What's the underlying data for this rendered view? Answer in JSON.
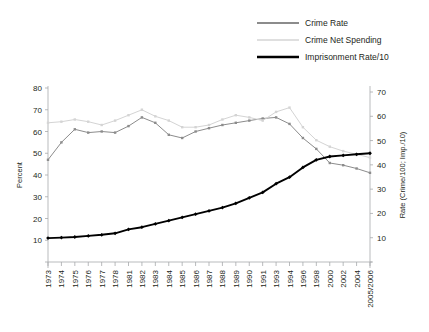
{
  "chart_data": {
    "type": "line",
    "title": "",
    "xlabel": "",
    "ylabel": "Percent",
    "y2label": "Rate (Crime/100; Imp./10)",
    "ylim": [
      0,
      80
    ],
    "y2lim": [
      0,
      70
    ],
    "yticks": [
      0,
      10,
      20,
      30,
      40,
      50,
      60,
      70,
      80
    ],
    "ytick_labels": [
      "",
      "10",
      "20",
      "30",
      "40",
      "50",
      "60",
      "70",
      "80"
    ],
    "y2ticks": [
      0,
      10,
      20,
      30,
      40,
      50,
      60,
      70
    ],
    "y2tick_labels": [
      "",
      "10",
      "20",
      "30",
      "40",
      "50",
      "60",
      "70"
    ],
    "grid": false,
    "legend_position": "top-right",
    "categories": [
      "1973",
      "1974",
      "1975",
      "1976",
      "1977",
      "1978",
      "1981",
      "1982",
      "1983",
      "1984",
      "1985",
      "1986",
      "1987",
      "1988",
      "1989",
      "1990",
      "1991",
      "1993",
      "1994",
      "1996",
      "1998",
      "2000",
      "2002",
      "2004",
      "2005/2006"
    ],
    "xtick_labels": [
      "1973",
      "1974",
      "1975",
      "1976",
      "1977",
      "1978",
      "1981",
      "1982",
      "1983",
      "1984",
      "1985",
      "1986",
      "1987",
      "1988",
      "1989",
      "1990",
      "1991",
      "1993",
      "1994",
      "1996",
      "1998",
      "2000",
      "2002",
      "2004",
      "2005/2006"
    ],
    "series": [
      {
        "name": "Crime Rate",
        "color": "#8c8c8c",
        "marker": "square",
        "axis": "left",
        "values": [
          47.0,
          55.0,
          61.0,
          59.5,
          60.0,
          59.5,
          62.5,
          66.5,
          64.0,
          58.5,
          57.0,
          60.0,
          61.5,
          63.0,
          64.0,
          65.0,
          66.0,
          66.5,
          63.5,
          57.0,
          52.0,
          45.5,
          44.5,
          43.0,
          41.0
        ]
      },
      {
        "name": "Crime Net Spending",
        "color": "#d4d4d4",
        "marker": "square",
        "axis": "left",
        "values": [
          64.0,
          64.5,
          65.5,
          64.5,
          63.0,
          65.0,
          67.5,
          70.0,
          67.0,
          65.0,
          62.0,
          62.0,
          63.0,
          65.5,
          67.5,
          66.5,
          65.0,
          69.0,
          71.0,
          62.0,
          56.0,
          53.0,
          51.0,
          49.5,
          48.0
        ]
      },
      {
        "name": "Imprisonment Rate/10",
        "color": "#000000",
        "marker": "diamond",
        "axis": "left",
        "values": [
          11.0,
          11.2,
          11.5,
          12.0,
          12.5,
          13.2,
          15.0,
          16.0,
          17.5,
          19.0,
          20.5,
          22.0,
          23.5,
          25.0,
          27.0,
          29.5,
          32.0,
          36.0,
          39.0,
          43.5,
          47.0,
          48.5,
          49.0,
          49.5,
          50.0
        ]
      }
    ],
    "legend": [
      {
        "label": "Crime Rate",
        "color": "#8c8c8c",
        "style": "solid-medium"
      },
      {
        "label": "Crime Net Spending",
        "color": "#d4d4d4",
        "style": "solid-light"
      },
      {
        "label": "Imprisonment Rate/10",
        "color": "#000000",
        "style": "solid-thick"
      }
    ]
  },
  "axes": {
    "left_title": "Percent",
    "right_title": "Rate (Crime/100; Imp./10)"
  }
}
